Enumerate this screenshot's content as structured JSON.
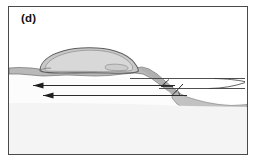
{
  "figure": {
    "panel_label": "(d)",
    "type": "geological-cross-section-diagram",
    "colors": {
      "frame_stroke": "#4a4a4a",
      "background": "#ffffff",
      "substrate_fill": "#fbfbfb",
      "gray_layer_fill": "#b9b9b9",
      "slump_body_fill": "#c9c9c9",
      "slump_body_highlight": "#d9d9d9",
      "outline_stroke": "#5a5a5a",
      "arrow_stroke": "#2b2b2b",
      "reference_line_stroke": "#3c3c3c"
    },
    "elements": {
      "slump_body_label": "thrust / slump sheet",
      "gray_layer_label": "displaced surface layer",
      "substrate_label": "undeformed substrate",
      "ramp_label": "ramp / fault surface",
      "upper_reference_line_label": "upper reference datum",
      "lower_reference_line_label": "lower reference datum",
      "transport_arrow_upper_label": "transport direction (upper)",
      "transport_arrow_lower_label": "transport direction (lower)",
      "angle_mark_left_label": "cut-off angle mark",
      "angle_mark_right_label": "ramp dip angle mark"
    },
    "annotations": {
      "arrow_count": 2,
      "arrow_direction": "left",
      "angle_mark_count": 2,
      "reference_line_count": 2
    }
  }
}
